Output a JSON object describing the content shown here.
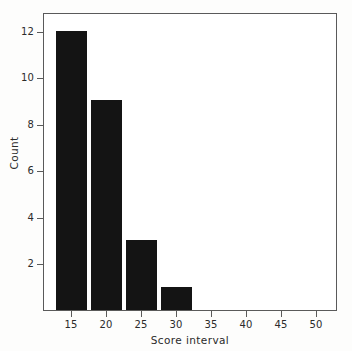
{
  "chart_data": {
    "type": "bar",
    "title": "",
    "subtitle": "",
    "xlabel": "Score interval",
    "ylabel": "Count",
    "categories": [
      "12.5-17.5",
      "17.5-22.5",
      "22.5-27.5",
      "27.5-32.5"
    ],
    "bin_centers": [
      15,
      20,
      25,
      30
    ],
    "bin_edges": [
      12.5,
      17.5,
      22.5,
      27.5,
      32.5
    ],
    "values": [
      12,
      9,
      3,
      1
    ],
    "series": [
      {
        "name": "Count",
        "values": [
          12,
          9,
          3,
          1
        ]
      }
    ],
    "xlim": [
      11.0,
      53.0
    ],
    "ylim": [
      0,
      12.8
    ],
    "xticks": [
      15,
      20,
      25,
      30,
      35,
      40,
      45,
      50
    ],
    "xtick_labels": [
      "15",
      "20",
      "25",
      "30",
      "35",
      "40",
      "45",
      "50"
    ],
    "yticks": [
      2,
      4,
      6,
      8,
      10,
      12
    ],
    "ytick_labels": [
      "2",
      "4",
      "6",
      "8",
      "10",
      "12"
    ],
    "grid": false,
    "legend": null,
    "legend_position": "none",
    "bar_color": "#141414",
    "frame_color": "#5a5a5a",
    "background_color": "#ffffff",
    "annotations": []
  }
}
